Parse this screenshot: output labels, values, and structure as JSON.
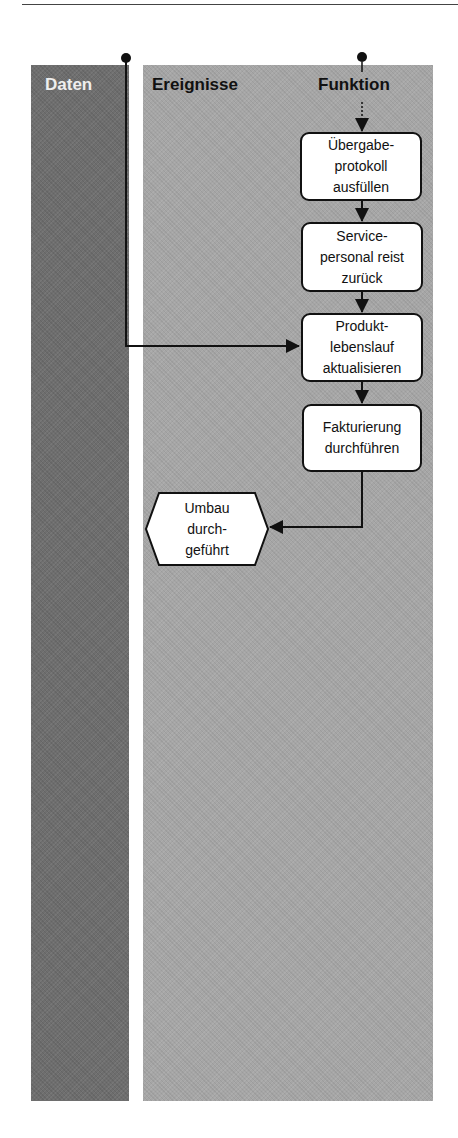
{
  "diagram": {
    "type": "EPC process chain (swimlane)",
    "columns": {
      "data": "Daten",
      "events": "Ereignisse",
      "function": "Funktion"
    },
    "functions": [
      {
        "id": "f1",
        "label": "Übergabe-\nprotokoll\nausfüllen"
      },
      {
        "id": "f2",
        "label": "Service-\npersonal reist\nzurück"
      },
      {
        "id": "f3",
        "label": "Produkt-\nlebenslauf\naktualisieren"
      },
      {
        "id": "f4",
        "label": "Fakturierung\ndurchführen"
      }
    ],
    "events": [
      {
        "id": "e1",
        "label": "Umbau\ndurch-\ngeführt"
      }
    ],
    "connections": [
      {
        "from": "start-connector-function",
        "to": "f1",
        "style": "dashed-then-arrow"
      },
      {
        "from": "f1",
        "to": "f2"
      },
      {
        "from": "f2",
        "to": "f3"
      },
      {
        "from": "start-connector-data",
        "to": "f3"
      },
      {
        "from": "f3",
        "to": "f4"
      },
      {
        "from": "f4",
        "to": "e1"
      }
    ],
    "colors": {
      "data_lane": "#6e6e6e",
      "main_lane": "#a6a6a6",
      "node_fill": "#ffffff",
      "stroke": "#111111"
    }
  }
}
